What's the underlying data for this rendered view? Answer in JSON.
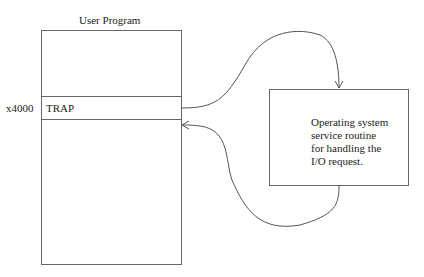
{
  "program": {
    "title": "User Program",
    "address": "x4000",
    "instruction": "TRAP"
  },
  "routine": {
    "lines": [
      "Operating system",
      "service routine",
      "for handling the",
      "I/O request."
    ]
  },
  "colors": {
    "stroke": "#555555",
    "text": "#222222"
  }
}
